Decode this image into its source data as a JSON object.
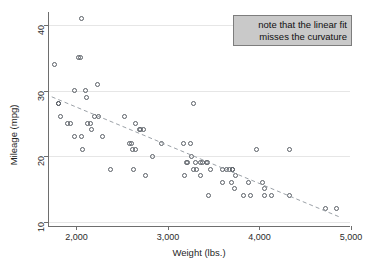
{
  "chart_data": {
    "type": "scatter",
    "title": "",
    "xlabel": "Weight (lbs.)",
    "ylabel": "Mileage (mpg)",
    "xlim": [
      1700,
      5000
    ],
    "ylim": [
      9.2,
      42
    ],
    "xticks": [
      2000,
      3000,
      4000,
      5000
    ],
    "xticklabels": [
      "2,000",
      "3,000",
      "4,000",
      "5,000"
    ],
    "yticks": [
      10,
      20,
      30,
      40
    ],
    "yticklabels": [
      "10",
      "20",
      "30",
      "40"
    ],
    "grid": "horizontal",
    "legend": "none",
    "marker": "open-circle",
    "marker_color": "#5a5f66",
    "points": [
      {
        "x": 1760,
        "y": 34
      },
      {
        "x": 1800,
        "y": 28
      },
      {
        "x": 1800,
        "y": 28
      },
      {
        "x": 1830,
        "y": 26
      },
      {
        "x": 1900,
        "y": 25
      },
      {
        "x": 1930,
        "y": 25
      },
      {
        "x": 1980,
        "y": 30
      },
      {
        "x": 1980,
        "y": 23
      },
      {
        "x": 2020,
        "y": 35
      },
      {
        "x": 2040,
        "y": 35
      },
      {
        "x": 2050,
        "y": 41
      },
      {
        "x": 2060,
        "y": 23
      },
      {
        "x": 2070,
        "y": 21
      },
      {
        "x": 2100,
        "y": 30
      },
      {
        "x": 2110,
        "y": 29
      },
      {
        "x": 2120,
        "y": 25
      },
      {
        "x": 2150,
        "y": 25
      },
      {
        "x": 2160,
        "y": 24
      },
      {
        "x": 2200,
        "y": 26
      },
      {
        "x": 2230,
        "y": 31
      },
      {
        "x": 2240,
        "y": 26
      },
      {
        "x": 2280,
        "y": 23
      },
      {
        "x": 2370,
        "y": 18
      },
      {
        "x": 2520,
        "y": 26
      },
      {
        "x": 2580,
        "y": 22
      },
      {
        "x": 2600,
        "y": 22
      },
      {
        "x": 2610,
        "y": 21
      },
      {
        "x": 2620,
        "y": 18
      },
      {
        "x": 2650,
        "y": 25
      },
      {
        "x": 2650,
        "y": 21
      },
      {
        "x": 2690,
        "y": 24
      },
      {
        "x": 2700,
        "y": 24
      },
      {
        "x": 2730,
        "y": 24
      },
      {
        "x": 2750,
        "y": 17
      },
      {
        "x": 2830,
        "y": 20
      },
      {
        "x": 2930,
        "y": 22
      },
      {
        "x": 3170,
        "y": 22
      },
      {
        "x": 3180,
        "y": 17
      },
      {
        "x": 3200,
        "y": 19
      },
      {
        "x": 3210,
        "y": 19
      },
      {
        "x": 3250,
        "y": 22
      },
      {
        "x": 3260,
        "y": 20
      },
      {
        "x": 3280,
        "y": 28
      },
      {
        "x": 3280,
        "y": 18
      },
      {
        "x": 3300,
        "y": 19
      },
      {
        "x": 3310,
        "y": 18
      },
      {
        "x": 3350,
        "y": 17
      },
      {
        "x": 3360,
        "y": 19
      },
      {
        "x": 3380,
        "y": 19
      },
      {
        "x": 3420,
        "y": 19
      },
      {
        "x": 3430,
        "y": 19
      },
      {
        "x": 3440,
        "y": 14
      },
      {
        "x": 3470,
        "y": 18
      },
      {
        "x": 3600,
        "y": 16
      },
      {
        "x": 3600,
        "y": 18
      },
      {
        "x": 3640,
        "y": 18
      },
      {
        "x": 3670,
        "y": 18
      },
      {
        "x": 3690,
        "y": 16
      },
      {
        "x": 3700,
        "y": 18
      },
      {
        "x": 3710,
        "y": 18
      },
      {
        "x": 3730,
        "y": 15
      },
      {
        "x": 3740,
        "y": 17
      },
      {
        "x": 3830,
        "y": 14
      },
      {
        "x": 3880,
        "y": 16
      },
      {
        "x": 3900,
        "y": 14
      },
      {
        "x": 3970,
        "y": 21
      },
      {
        "x": 4030,
        "y": 16
      },
      {
        "x": 4060,
        "y": 15
      },
      {
        "x": 4060,
        "y": 14
      },
      {
        "x": 4130,
        "y": 14
      },
      {
        "x": 4330,
        "y": 21
      },
      {
        "x": 4330,
        "y": 14
      },
      {
        "x": 4720,
        "y": 12
      },
      {
        "x": 4840,
        "y": 12
      }
    ],
    "fit": {
      "type": "linear",
      "style": "dashed",
      "color": "#9aa0a6",
      "x0": 1730,
      "y0": 29.0,
      "x1": 4900,
      "y1": 10.5
    },
    "annotation": {
      "line1": "note that the linear fit",
      "line2": "misses the curvature",
      "background": "#c9c9c9",
      "border": "#7d7d7d",
      "align": "right"
    }
  }
}
